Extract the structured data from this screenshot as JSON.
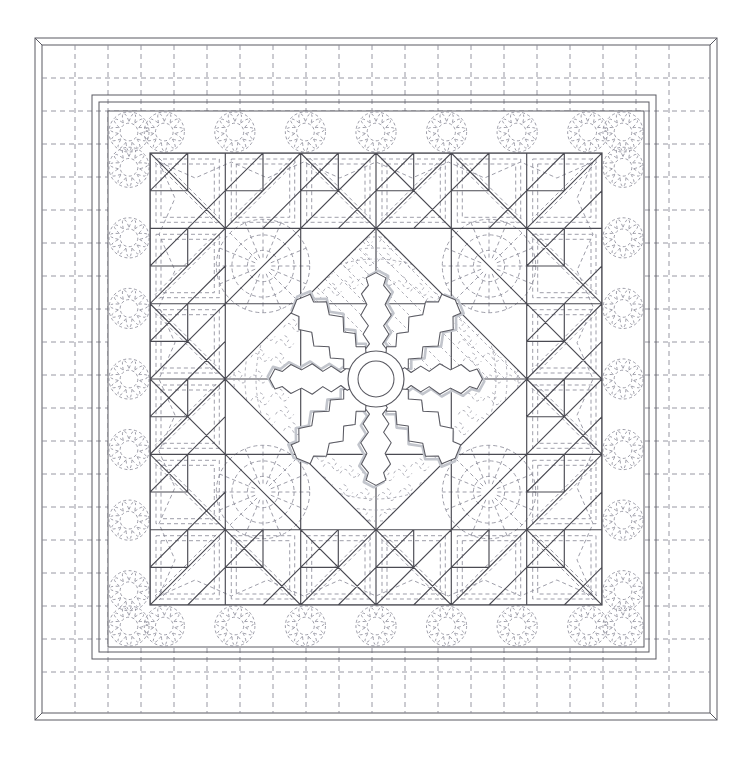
{
  "document": {
    "title": "Quilt Pattern Diagram",
    "subject": "medallion-quilt-line-drawing",
    "canvas": {
      "width": 749,
      "height": 762,
      "background": "#ffffff"
    }
  },
  "palette": {
    "outline_solid": "#4a4a52",
    "outline_solid_dark": "#3a3a42",
    "quilting_dashed": "#8d8d99",
    "applique_shadow": "#b9bcc4",
    "background": "#ffffff",
    "binding_edge": "#5a5a62"
  },
  "layout": {
    "frame": {
      "x": 35,
      "y": 38,
      "width": 682,
      "height": 682,
      "note": "outer binding edge with mitred corners"
    },
    "binding_inset": 7,
    "outer_border": {
      "x": 42,
      "y": 45,
      "width": 668,
      "height": 668,
      "label": "outer border with crosshatch grid quilting"
    },
    "inner_strips": [
      {
        "inset": 57,
        "label": "narrow sashing strip 1"
      },
      {
        "inset": 64,
        "label": "narrow sashing strip 2"
      },
      {
        "inset": 73,
        "label": "narrow sashing strip 3"
      }
    ],
    "feather_border": {
      "x": 108,
      "y": 111,
      "width": 536,
      "height": 536,
      "label": "feathered wreath border"
    },
    "pieced_field": {
      "x": 150,
      "y": 153,
      "width": 452,
      "height": 452,
      "label": "pieced blocks field",
      "grid": 6
    },
    "center_diamond": {
      "cx": 376,
      "cy": 379,
      "half": 151,
      "label": "on-point centre medallion square"
    },
    "applique_medallion": {
      "cx": 376,
      "cy": 379,
      "radius": 112,
      "petals": 8,
      "hub_outer_r": 28,
      "hub_inner_r": 18,
      "label": "eight petal appliqué snowflake medallion"
    }
  },
  "quilting": {
    "outer_border_grid": {
      "label": "crosshatch grid quilting",
      "vertical_spacing": 33,
      "horizontal_spacing": 33,
      "dash": "5 4"
    },
    "feather_border": {
      "label": "feathered circle wreaths",
      "wreaths_per_side": 7,
      "wreath_radius": 17,
      "feather_lobes": 11
    },
    "block_quilting": {
      "label": "echo outline and stipple quilting inside pieced blocks",
      "dash": "4 3"
    },
    "centre_quilting": {
      "label": "stipple / meander fill with echo rings around appliqué",
      "dash": "3 3"
    }
  },
  "blocks": {
    "grid_rows": 6,
    "grid_cols": 6,
    "cell": 75.3,
    "corner_block": "sawtooth pinwheel with half square triangles",
    "side_block": "flying geese sawtooth",
    "centre_block": "plain on-point square with feather stipple",
    "sawtooth_count_per_edge": 6
  },
  "legend": {
    "solid_line": "pieced seam line",
    "dashed_line": "quilting stitch line",
    "grey_line": "appliqué shadow / under-layer"
  }
}
